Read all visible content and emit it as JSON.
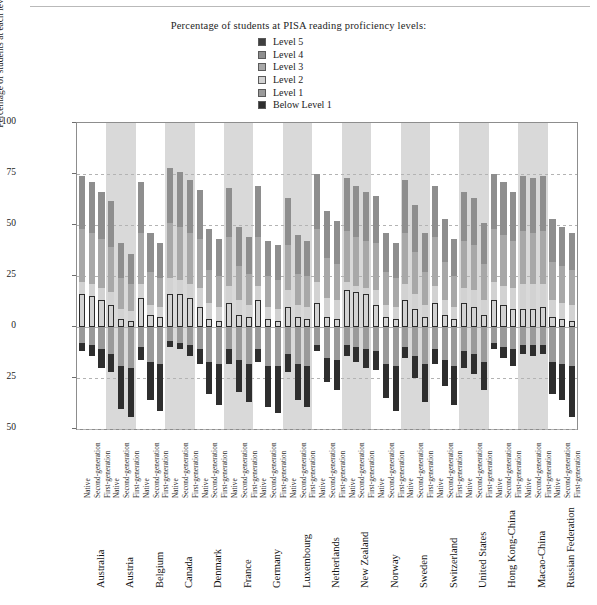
{
  "title": "Percentage of students at PISA reading proficiency levels:",
  "legend": {
    "position": "top-center",
    "items": [
      {
        "label": "Level 5",
        "color": "#3f3f3f"
      },
      {
        "label": "Level 4",
        "color": "#8e8e8e"
      },
      {
        "label": "Level 3",
        "color": "#a8a8a8"
      },
      {
        "label": "Level 2",
        "color": "#d2d2d2"
      },
      {
        "label": "Level 1",
        "color": "#9a9a9a"
      },
      {
        "label": "Below Level 1",
        "color": "#2e2e2e"
      }
    ]
  },
  "axes": {
    "ylabel": "Percentage of students at each level of proficiency on reading scale",
    "yticks": [
      "100",
      "75",
      "50",
      "25",
      "0",
      "25",
      "50"
    ],
    "ytick_values": [
      100,
      75,
      50,
      25,
      0,
      -25,
      -50
    ],
    "ylim": [
      -50,
      100
    ],
    "grid": true,
    "zero_line": 0
  },
  "generations": [
    "Native",
    "Second-generation",
    "First-generation"
  ],
  "chart_data": {
    "type": "bar",
    "title": "Percentage of students at PISA reading proficiency levels:",
    "xlabel": "",
    "ylabel": "Percentage of students at each level of proficiency on reading scale",
    "ylim": [
      -50,
      100
    ],
    "grid": true,
    "legend_position": "top-center",
    "orientation": "vertical-diverging-stacked",
    "note": "Positive axis stacks Level 2..Level 5 upward from 0; negative axis stacks Level 1 and Below Level 1 downward from 0.",
    "categories": [
      "Australia",
      "Austria",
      "Belgium",
      "Canada",
      "Denmark",
      "France",
      "Germany",
      "Luxembourg",
      "Netherlands",
      "New Zealand",
      "Norway",
      "Sweden",
      "Switzerland",
      "United States",
      "Hong Kong-China",
      "Macao-China",
      "Russian Federation"
    ],
    "subcategories": [
      "Native",
      "Second-generation",
      "First-generation"
    ],
    "series": [
      {
        "name": "Level 5",
        "direction": "up",
        "color": "#3f3f3f"
      },
      {
        "name": "Level 4",
        "direction": "up",
        "color": "#8e8e8e"
      },
      {
        "name": "Level 3",
        "direction": "up",
        "color": "#a8a8a8"
      },
      {
        "name": "Level 2",
        "direction": "up",
        "color": "#d2d2d2"
      },
      {
        "name": "Level 1",
        "direction": "down",
        "color": "#9a9a9a"
      },
      {
        "name": "Below Level 1",
        "direction": "down",
        "color": "#2e2e2e"
      }
    ],
    "bars": [
      {
        "country": "Australia",
        "gen": "Native",
        "l5": 16,
        "l4": 74,
        "l3": 48,
        "l2": 22,
        "l1": -8,
        "below": -12
      },
      {
        "country": "Australia",
        "gen": "Second-generation",
        "l5": 15,
        "l4": 71,
        "l3": 46,
        "l2": 21,
        "l1": -9,
        "below": -14
      },
      {
        "country": "Australia",
        "gen": "First-generation",
        "l5": 13,
        "l4": 66,
        "l3": 43,
        "l2": 19,
        "l1": -11,
        "below": -20
      },
      {
        "country": "Austria",
        "gen": "Native",
        "l5": 11,
        "l4": 62,
        "l3": 39,
        "l2": 17,
        "l1": -13,
        "below": -22
      },
      {
        "country": "Austria",
        "gen": "Second-generation",
        "l5": 4,
        "l4": 41,
        "l3": 24,
        "l2": 9,
        "l1": -19,
        "below": -40
      },
      {
        "country": "Austria",
        "gen": "First-generation",
        "l5": 3,
        "l4": 36,
        "l3": 21,
        "l2": 8,
        "l1": -20,
        "below": -44
      },
      {
        "country": "Belgium",
        "gen": "Native",
        "l5": 14,
        "l4": 71,
        "l3": 46,
        "l2": 21,
        "l1": -10,
        "below": -16
      },
      {
        "country": "Belgium",
        "gen": "Second-generation",
        "l5": 6,
        "l4": 46,
        "l3": 27,
        "l2": 11,
        "l1": -17,
        "below": -36
      },
      {
        "country": "Belgium",
        "gen": "First-generation",
        "l5": 5,
        "l4": 41,
        "l3": 24,
        "l2": 10,
        "l1": -18,
        "below": -41
      },
      {
        "country": "Canada",
        "gen": "Native",
        "l5": 16,
        "l4": 78,
        "l3": 51,
        "l2": 24,
        "l1": -7,
        "below": -10
      },
      {
        "country": "Canada",
        "gen": "Second-generation",
        "l5": 16,
        "l4": 76,
        "l3": 49,
        "l2": 23,
        "l1": -8,
        "below": -11
      },
      {
        "country": "Canada",
        "gen": "First-generation",
        "l5": 14,
        "l4": 72,
        "l3": 46,
        "l2": 21,
        "l1": -9,
        "below": -14
      },
      {
        "country": "Denmark",
        "gen": "Native",
        "l5": 10,
        "l4": 67,
        "l3": 43,
        "l2": 19,
        "l1": -11,
        "below": -18
      },
      {
        "country": "Denmark",
        "gen": "Second-generation",
        "l5": 4,
        "l4": 48,
        "l3": 28,
        "l2": 12,
        "l1": -17,
        "below": -33
      },
      {
        "country": "Denmark",
        "gen": "First-generation",
        "l5": 3,
        "l4": 43,
        "l3": 25,
        "l2": 10,
        "l1": -18,
        "below": -38
      },
      {
        "country": "France",
        "gen": "Native",
        "l5": 12,
        "l4": 68,
        "l3": 44,
        "l2": 20,
        "l1": -11,
        "below": -18
      },
      {
        "country": "France",
        "gen": "Second-generation",
        "l5": 6,
        "l4": 49,
        "l3": 30,
        "l2": 13,
        "l1": -16,
        "below": -32
      },
      {
        "country": "France",
        "gen": "First-generation",
        "l5": 5,
        "l4": 44,
        "l3": 26,
        "l2": 11,
        "l1": -18,
        "below": -37
      },
      {
        "country": "Germany",
        "gen": "Native",
        "l5": 13,
        "l4": 69,
        "l3": 44,
        "l2": 20,
        "l1": -11,
        "below": -17
      },
      {
        "country": "Germany",
        "gen": "Second-generation",
        "l5": 4,
        "l4": 42,
        "l3": 25,
        "l2": 10,
        "l1": -19,
        "below": -39
      },
      {
        "country": "Germany",
        "gen": "First-generation",
        "l5": 3,
        "l4": 40,
        "l3": 23,
        "l2": 9,
        "l1": -19,
        "below": -42
      },
      {
        "country": "Luxembourg",
        "gen": "Native",
        "l5": 10,
        "l4": 63,
        "l3": 40,
        "l2": 18,
        "l1": -13,
        "below": -22
      },
      {
        "country": "Luxembourg",
        "gen": "Second-generation",
        "l5": 5,
        "l4": 45,
        "l3": 26,
        "l2": 11,
        "l1": -18,
        "below": -36
      },
      {
        "country": "Luxembourg",
        "gen": "First-generation",
        "l5": 4,
        "l4": 42,
        "l3": 25,
        "l2": 10,
        "l1": -19,
        "below": -39
      },
      {
        "country": "Netherlands",
        "gen": "Native",
        "l5": 12,
        "l4": 75,
        "l3": 48,
        "l2": 22,
        "l1": -9,
        "below": -12
      },
      {
        "country": "Netherlands",
        "gen": "Second-generation",
        "l5": 5,
        "l4": 57,
        "l3": 34,
        "l2": 14,
        "l1": -15,
        "below": -27
      },
      {
        "country": "Netherlands",
        "gen": "First-generation",
        "l5": 4,
        "l4": 52,
        "l3": 31,
        "l2": 13,
        "l1": -16,
        "below": -31
      },
      {
        "country": "New Zealand",
        "gen": "Native",
        "l5": 18,
        "l4": 73,
        "l3": 47,
        "l2": 22,
        "l1": -9,
        "below": -14
      },
      {
        "country": "New Zealand",
        "gen": "Second-generation",
        "l5": 17,
        "l4": 69,
        "l3": 44,
        "l2": 20,
        "l1": -10,
        "below": -17
      },
      {
        "country": "New Zealand",
        "gen": "First-generation",
        "l5": 16,
        "l4": 66,
        "l3": 42,
        "l2": 19,
        "l1": -11,
        "below": -20
      },
      {
        "country": "Norway",
        "gen": "Native",
        "l5": 11,
        "l4": 64,
        "l3": 41,
        "l2": 18,
        "l1": -12,
        "below": -21
      },
      {
        "country": "Norway",
        "gen": "Second-generation",
        "l5": 5,
        "l4": 46,
        "l3": 27,
        "l2": 11,
        "l1": -18,
        "below": -35
      },
      {
        "country": "Norway",
        "gen": "First-generation",
        "l5": 4,
        "l4": 41,
        "l3": 24,
        "l2": 10,
        "l1": -19,
        "below": -41
      },
      {
        "country": "Sweden",
        "gen": "Native",
        "l5": 13,
        "l4": 72,
        "l3": 46,
        "l2": 21,
        "l1": -10,
        "below": -15
      },
      {
        "country": "Sweden",
        "gen": "Second-generation",
        "l5": 9,
        "l4": 60,
        "l3": 37,
        "l2": 16,
        "l1": -14,
        "below": -25
      },
      {
        "country": "Sweden",
        "gen": "First-generation",
        "l5": 5,
        "l4": 46,
        "l3": 27,
        "l2": 11,
        "l1": -18,
        "below": -37
      },
      {
        "country": "Switzerland",
        "gen": "Native",
        "l5": 12,
        "l4": 69,
        "l3": 44,
        "l2": 20,
        "l1": -11,
        "below": -18
      },
      {
        "country": "Switzerland",
        "gen": "Second-generation",
        "l5": 6,
        "l4": 53,
        "l3": 32,
        "l2": 13,
        "l1": -16,
        "below": -29
      },
      {
        "country": "Switzerland",
        "gen": "First-generation",
        "l5": 4,
        "l4": 43,
        "l3": 25,
        "l2": 10,
        "l1": -19,
        "below": -38
      },
      {
        "country": "United States",
        "gen": "Native",
        "l5": 12,
        "l4": 66,
        "l3": 42,
        "l2": 19,
        "l1": -12,
        "below": -20
      },
      {
        "country": "United States",
        "gen": "Second-generation",
        "l5": 10,
        "l4": 63,
        "l3": 40,
        "l2": 18,
        "l1": -13,
        "below": -23
      },
      {
        "country": "United States",
        "gen": "First-generation",
        "l5": 6,
        "l4": 51,
        "l3": 31,
        "l2": 13,
        "l1": -17,
        "below": -31
      },
      {
        "country": "Hong Kong-China",
        "gen": "Native",
        "l5": 13,
        "l4": 75,
        "l3": 48,
        "l2": 22,
        "l1": -8,
        "below": -11
      },
      {
        "country": "Hong Kong-China",
        "gen": "Second-generation",
        "l5": 11,
        "l4": 71,
        "l3": 45,
        "l2": 20,
        "l1": -10,
        "below": -15
      },
      {
        "country": "Hong Kong-China",
        "gen": "First-generation",
        "l5": 9,
        "l4": 66,
        "l3": 42,
        "l2": 19,
        "l1": -11,
        "below": -19
      },
      {
        "country": "Macao-China",
        "gen": "Native",
        "l5": 9,
        "l4": 74,
        "l3": 47,
        "l2": 21,
        "l1": -9,
        "below": -13
      },
      {
        "country": "Macao-China",
        "gen": "Second-generation",
        "l5": 9,
        "l4": 73,
        "l3": 46,
        "l2": 21,
        "l1": -9,
        "below": -14
      },
      {
        "country": "Macao-China",
        "gen": "First-generation",
        "l5": 10,
        "l4": 74,
        "l3": 47,
        "l2": 21,
        "l1": -9,
        "below": -13
      },
      {
        "country": "Russian Federation",
        "gen": "Native",
        "l5": 5,
        "l4": 53,
        "l3": 32,
        "l2": 13,
        "l1": -17,
        "below": -33
      },
      {
        "country": "Russian Federation",
        "gen": "Second-generation",
        "l5": 4,
        "l4": 49,
        "l3": 30,
        "l2": 12,
        "l1": -18,
        "below": -36
      },
      {
        "country": "Russian Federation",
        "gen": "First-generation",
        "l5": 3,
        "l4": 46,
        "l3": 28,
        "l2": 11,
        "l1": -19,
        "below": -44
      }
    ]
  }
}
